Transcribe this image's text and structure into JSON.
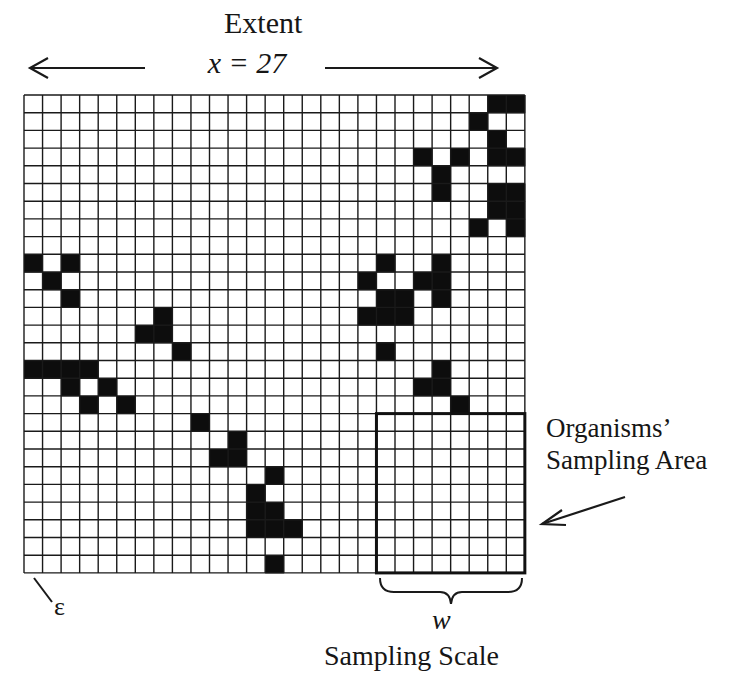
{
  "header": {
    "title": "Extent",
    "extent_value": "x = 27"
  },
  "labels": {
    "organisms_line1": "Organisms’",
    "organisms_line2": "Sampling Area",
    "w": "w",
    "sampling_scale": "Sampling Scale",
    "epsilon": "ε"
  },
  "grid": {
    "cols": 27,
    "rows": 27,
    "origin_x": 24,
    "origin_y": 95,
    "cell_w": 18.55,
    "cell_h": 17.7,
    "line_color": "#1a1a1a",
    "fill_color": "#0d0d0d",
    "filled_cells": [
      [
        0,
        25
      ],
      [
        0,
        26
      ],
      [
        1,
        24
      ],
      [
        2,
        25
      ],
      [
        3,
        21
      ],
      [
        3,
        23
      ],
      [
        3,
        25
      ],
      [
        3,
        26
      ],
      [
        4,
        22
      ],
      [
        5,
        22
      ],
      [
        5,
        25
      ],
      [
        5,
        26
      ],
      [
        6,
        25
      ],
      [
        6,
        26
      ],
      [
        7,
        24
      ],
      [
        7,
        26
      ],
      [
        9,
        0
      ],
      [
        9,
        2
      ],
      [
        9,
        19
      ],
      [
        9,
        22
      ],
      [
        10,
        1
      ],
      [
        10,
        18
      ],
      [
        10,
        21
      ],
      [
        10,
        22
      ],
      [
        11,
        2
      ],
      [
        11,
        19
      ],
      [
        11,
        20
      ],
      [
        11,
        22
      ],
      [
        12,
        7
      ],
      [
        12,
        18
      ],
      [
        12,
        19
      ],
      [
        12,
        20
      ],
      [
        13,
        6
      ],
      [
        13,
        7
      ],
      [
        14,
        8
      ],
      [
        14,
        19
      ],
      [
        15,
        0
      ],
      [
        15,
        1
      ],
      [
        15,
        2
      ],
      [
        15,
        3
      ],
      [
        15,
        22
      ],
      [
        16,
        2
      ],
      [
        16,
        4
      ],
      [
        16,
        21
      ],
      [
        16,
        22
      ],
      [
        17,
        3
      ],
      [
        17,
        5
      ],
      [
        17,
        23
      ],
      [
        18,
        9
      ],
      [
        19,
        11
      ],
      [
        20,
        10
      ],
      [
        20,
        11
      ],
      [
        21,
        13
      ],
      [
        22,
        12
      ],
      [
        23,
        12
      ],
      [
        23,
        13
      ],
      [
        24,
        12
      ],
      [
        24,
        13
      ],
      [
        24,
        14
      ],
      [
        26,
        13
      ]
    ],
    "sampling_area": {
      "col_start": 19,
      "col_end": 26,
      "row_start": 18,
      "row_end": 26
    }
  }
}
